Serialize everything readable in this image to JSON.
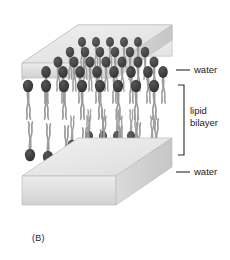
{
  "figure": {
    "caption": "(B)",
    "panel_label": "(B)",
    "labels": {
      "water_top": "water",
      "water_bottom": "water",
      "bilayer_line1": "lipid",
      "bilayer_line2": "bilayer"
    },
    "colors": {
      "head": "#3a3a3a",
      "head_light": "#4a4a4a",
      "tail": "#9b9b9b",
      "water_top_face": "#e8e8e8",
      "water_front_face": "#d8d8d8",
      "water_side_face": "#cfcfcf",
      "text": "#1a1a1a",
      "leader": "#2a2a2a",
      "background": "#ffffff"
    },
    "structure": {
      "type": "lipid-bilayer-3d-block",
      "upper_leaflet": "phospholipid heads up, tails down",
      "lower_leaflet": "phospholipid heads down, tails up",
      "medium": "water"
    }
  }
}
